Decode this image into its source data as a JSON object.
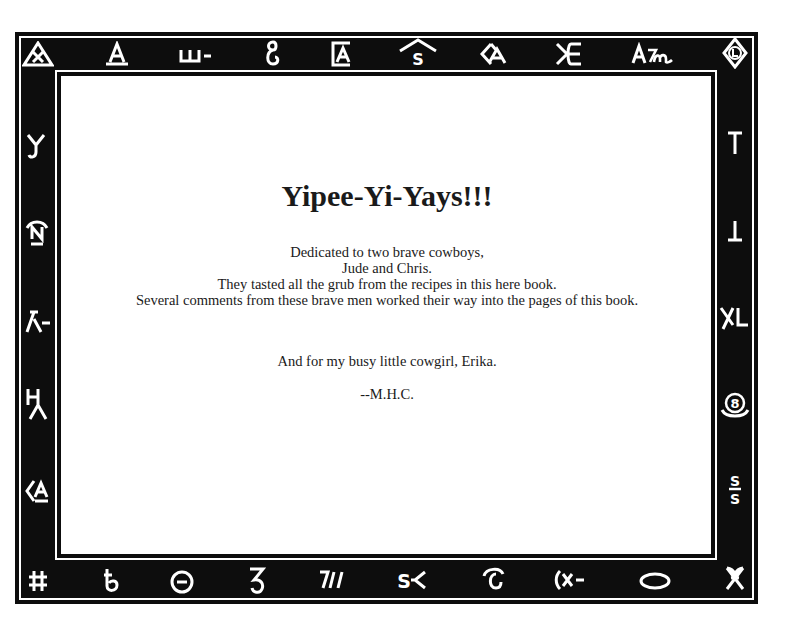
{
  "page": {
    "title": "Yipee-Yi-Yays!!!",
    "dedication_lines": [
      "Dedicated to two brave cowboys,",
      "Jude and Chris.",
      "They tasted all the grub from the recipes in this here book.",
      "Several comments from these brave men worked their way into the pages of this book."
    ],
    "secondary_dedication": "And for my busy little cowgirl, Erika.",
    "signature": "--M.H.C."
  },
  "border": {
    "frame_color": "#0d0d0d",
    "brand_color": "#ffffff",
    "top_brands": [
      {
        "name": "triangle-x-brand",
        "glyph": ""
      },
      {
        "name": "a-brand",
        "glyph": "A"
      },
      {
        "name": "e-bar-brand",
        "glyph": "ш-"
      },
      {
        "name": "script-g-brand",
        "glyph": "ℊ"
      },
      {
        "name": "boxed-a-brand",
        "glyph": ""
      },
      {
        "name": "roof-s-brand",
        "glyph": ""
      },
      {
        "name": "diamond-a-brand",
        "glyph": ""
      },
      {
        "name": "x-e-brand",
        "glyph": "ЖE"
      },
      {
        "name": "am-brand",
        "glyph": "A𝓂"
      },
      {
        "name": "diamond-l-brand",
        "glyph": ""
      }
    ],
    "left_brands": [
      {
        "name": "y-brand",
        "glyph": "Y"
      },
      {
        "name": "n-rocker-brand",
        "glyph": "N"
      },
      {
        "name": "lambda-bar-brand",
        "glyph": "⅄-"
      },
      {
        "name": "h-lambda-brand",
        "glyph": "H⅄"
      },
      {
        "name": "less-than-a-brand",
        "glyph": "<A"
      }
    ],
    "right_brands": [
      {
        "name": "t-brand",
        "glyph": "T"
      },
      {
        "name": "inverted-t-brand",
        "glyph": "⊥"
      },
      {
        "name": "xl-brand",
        "glyph": "XL"
      },
      {
        "name": "circle-8-brand",
        "glyph": "⑧"
      },
      {
        "name": "s-bar-s-brand",
        "glyph": "S/S"
      }
    ],
    "bottom_brands": [
      {
        "name": "hash-brand",
        "glyph": "#"
      },
      {
        "name": "script-t-brand",
        "glyph": "ҍ"
      },
      {
        "name": "circle-bar-brand",
        "glyph": "⊖"
      },
      {
        "name": "script-z-brand",
        "glyph": "Ƨ"
      },
      {
        "name": "seven-bars-brand",
        "glyph": "7//"
      },
      {
        "name": "s-lazy-y-brand",
        "glyph": "S≺"
      },
      {
        "name": "rocking-c-brand",
        "glyph": "Ͼ"
      },
      {
        "name": "paren-x-bar-brand",
        "glyph": "(x-"
      },
      {
        "name": "oval-brand",
        "glyph": "O"
      },
      {
        "name": "script-ampersand-brand",
        "glyph": "&"
      }
    ]
  }
}
